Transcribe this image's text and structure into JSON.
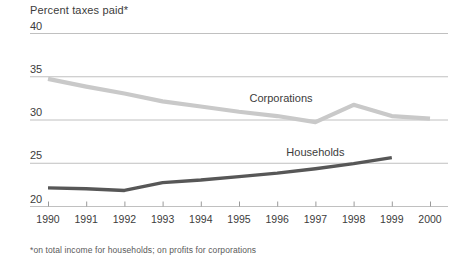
{
  "chart_data": {
    "type": "line",
    "title": "Percent taxes paid*",
    "footnote": "*on total income for households; on profits for corporations",
    "xlabel": "",
    "ylabel": "",
    "grid": true,
    "legend_position": "inline-labels",
    "x": [
      1990,
      1991,
      1992,
      1993,
      1994,
      1995,
      1996,
      1997,
      1998,
      1999,
      2000
    ],
    "x_tick_labels": [
      "1990",
      "1991",
      "1992",
      "1993",
      "1994",
      "1995",
      "1996",
      "1997",
      "1998",
      "1999",
      "2000"
    ],
    "y_tick_labels": [
      "40",
      "35",
      "30",
      "25",
      "20"
    ],
    "y_ticks": [
      40,
      35,
      30,
      25,
      20
    ],
    "ylim": [
      20,
      40
    ],
    "xlim": [
      1990,
      2000
    ],
    "series": [
      {
        "name": "Corporations",
        "color": "#c9c9c9",
        "label_x": 1996.1,
        "label_y": 32.2,
        "x": [
          1990,
          1991,
          1992,
          1993,
          1994,
          1995,
          1996,
          1997,
          1998,
          1999,
          2000
        ],
        "values": [
          34.7,
          33.8,
          33.0,
          32.1,
          31.5,
          30.9,
          30.4,
          29.7,
          31.7,
          30.4,
          30.1
        ]
      },
      {
        "name": "Households",
        "color": "#575757",
        "label_x": 1997.0,
        "label_y": 26.0,
        "x": [
          1990,
          1991,
          1992,
          1993,
          1994,
          1995,
          1996,
          1997,
          1998,
          1999
        ],
        "values": [
          22.1,
          22.0,
          21.8,
          22.7,
          23.0,
          23.4,
          23.8,
          24.3,
          24.9,
          25.6
        ]
      }
    ]
  },
  "axis": {
    "y_label_x_px": 30,
    "plot_left_px": 48,
    "plot_right_px": 430,
    "grid_color": "#c0c0c0",
    "axis_color": "#9a9a9a"
  }
}
